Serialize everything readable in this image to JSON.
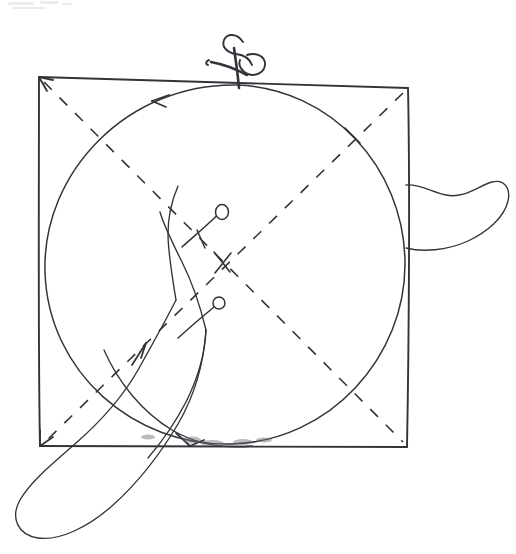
{
  "document": {
    "title": "Hand-drawn sewing pattern diagram",
    "medium": "pen-on-paper scan",
    "background_color": "#ffffff",
    "ink_color": "#33333a",
    "canvas": {
      "width": 516,
      "height": 554
    }
  },
  "diagram_data": {
    "type": "line-drawing",
    "description": "A hand-drawn square with an inscribed circle, two dashed corner-to-corner diagonals, a pair of scissors cutting at the top edge, two pin markers inside, and two elongated fabric lobes protruding at the right side and the lower-left corner.",
    "elements": [
      {
        "id": "square",
        "name": "square-outline",
        "shape": "quadrilateral",
        "stroke": "solid",
        "corners": [
          {
            "label": "top-left",
            "x": 39,
            "y": 77
          },
          {
            "label": "top-right",
            "x": 408,
            "y": 88
          },
          {
            "label": "bottom-right",
            "x": 407,
            "y": 447
          },
          {
            "label": "bottom-left",
            "x": 40,
            "y": 446
          }
        ]
      },
      {
        "id": "circle",
        "name": "inscribed-circle",
        "shape": "circle",
        "stroke": "solid",
        "center_x": 224,
        "center_y": 265,
        "radius_x": 181,
        "radius_y": 182,
        "note": "tangent to all four sides of the square"
      },
      {
        "id": "diagonal-nw-se",
        "name": "diagonal-dashed-nw-se",
        "shape": "line",
        "stroke": "dashed",
        "from": {
          "x": 44,
          "y": 82
        },
        "to": {
          "x": 403,
          "y": 442
        }
      },
      {
        "id": "diagonal-ne-sw",
        "name": "diagonal-dashed-ne-sw",
        "shape": "line",
        "stroke": "dashed",
        "from": {
          "x": 403,
          "y": 93
        },
        "to": {
          "x": 45,
          "y": 442
        }
      },
      {
        "id": "scissors",
        "name": "scissors",
        "shape": "tool-glyph",
        "x": 238,
        "y": 55,
        "note": "blades closed, pointing down, cutting the top edge of the square"
      },
      {
        "id": "pin-upper",
        "name": "pin-marker-upper",
        "shape": "pin",
        "head_x": 222,
        "head_y": 212,
        "head_radius": 6,
        "tail_x": 182,
        "tail_y": 247
      },
      {
        "id": "pin-lower",
        "name": "pin-marker-lower",
        "shape": "pin",
        "head_x": 219,
        "head_y": 303,
        "head_radius": 6,
        "tail_x": 178,
        "tail_y": 338
      },
      {
        "id": "lobe-right",
        "name": "fabric-lobe-right",
        "shape": "closed-curve",
        "anchor_x": 406,
        "anchor_y": 185,
        "extent_x": 506,
        "extent_y": 245,
        "note": "curved tongue-like flap extending to the right of the square"
      },
      {
        "id": "lobe-bottom-left",
        "name": "fabric-lobe-bottom-left",
        "shape": "closed-curve",
        "anchor_x": 175,
        "anchor_y": 300,
        "extent_x": 18,
        "extent_y": 528,
        "note": "long tapering loop sweeping from inside the circle down past the lower-left corner"
      }
    ],
    "annotations": [
      {
        "id": "arrow-circle-ccw",
        "name": "arrow-counterclockwise",
        "x": 155,
        "y": 100,
        "direction": "left",
        "on": "circle"
      },
      {
        "id": "arrow-corner-tl",
        "name": "arrow-corner-top-left",
        "x": 42,
        "y": 80,
        "direction": "up-left",
        "on": "square"
      },
      {
        "id": "arrow-corner-bl",
        "name": "arrow-corner-bottom-left",
        "x": 43,
        "y": 443,
        "direction": "down-left",
        "on": "square"
      },
      {
        "id": "arrow-diagonal-up",
        "name": "arrow-diagonal-upward",
        "x": 140,
        "y": 355,
        "direction": "up-right",
        "on": "diagonal-ne-sw"
      },
      {
        "id": "tick-upper-right",
        "name": "tick-mark-upper-right",
        "x": 352,
        "y": 135,
        "on": "circle"
      },
      {
        "id": "tick-center",
        "name": "tick-mark-center",
        "x": 222,
        "y": 262,
        "on": "diagonal-crossing"
      }
    ]
  }
}
